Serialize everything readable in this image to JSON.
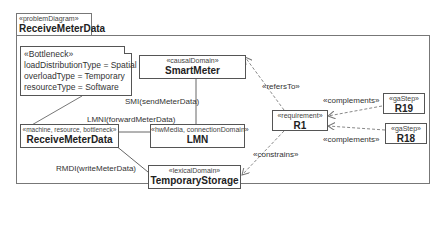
{
  "diagram": {
    "frame": {
      "stereotype": "«problemDiagram»",
      "title": "ReceiveMeterData"
    },
    "note": {
      "lines": [
        "«Bottleneck»",
        "loadDistributionType = Spatial",
        "overloadType = Temporary",
        "resourceType = Software"
      ]
    },
    "nodes": {
      "smart_meter": {
        "stereotype": "«causalDomain»",
        "name": "SmartMeter"
      },
      "receive_meter_data": {
        "stereotype": "«machine, resource, bottleneck»",
        "name": "ReceiveMeterData"
      },
      "lmn": {
        "stereotype": "«hwMedia, connectionDomain»",
        "name": "LMN"
      },
      "temporary_storage": {
        "stereotype": "«lexicalDomain»",
        "name": "TemporaryStorage"
      },
      "r1": {
        "stereotype": "«requirement»",
        "name": "R1"
      },
      "r19": {
        "stereotype": "«gaStep»",
        "name": "R19"
      },
      "r18": {
        "stereotype": "«gaStep»",
        "name": "R18"
      }
    },
    "edges": {
      "smi": "SMI(sendMeterData)",
      "lmni": "LMNI(forwardMeterData)",
      "rmdi": "RMDI(writeMeterData)",
      "refers_to": "«refersTo»",
      "constrains": "«constrains»",
      "complements_r19": "«complements»",
      "complements_r18": "«complements»"
    }
  }
}
